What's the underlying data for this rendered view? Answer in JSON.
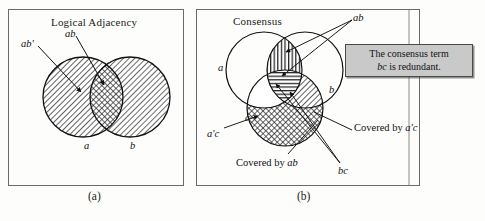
{
  "figure": {
    "panels": [
      {
        "id": "a",
        "caption": "(a)",
        "title": "Logical Adjacency",
        "labels": {
          "ab_prime": "ab'",
          "ab": "ab",
          "a": "a",
          "b": "b"
        },
        "regions": [
          {
            "name": "a-only",
            "fill": "diagonal-hatch"
          },
          {
            "name": "b-only",
            "fill": "diagonal-hatch"
          },
          {
            "name": "a-and-b",
            "fill": "cross-hatch"
          }
        ]
      },
      {
        "id": "b",
        "caption": "(b)",
        "title": "Consensus",
        "labels": {
          "ab": "ab",
          "a": "a",
          "b": "b",
          "c": "c",
          "a_prime_c": "a'c",
          "bc": "bc",
          "covered_by_ab": "Covered by ",
          "covered_by_ab_term": "ab",
          "covered_by_apc": "Covered by ",
          "covered_by_apc_term": "a'c"
        },
        "callout": {
          "line1": "The consensus term",
          "line2_term": "bc",
          "line2_rest": " is redundant."
        },
        "regions": [
          {
            "name": "ab-not-c",
            "fill": "vertical-hatch"
          },
          {
            "name": "abc",
            "fill": "horizontal-hatch"
          },
          {
            "name": "bc-not-a",
            "fill": "diagonal-hatch"
          },
          {
            "name": "c-not-a",
            "fill": "cross-hatch"
          }
        ]
      }
    ],
    "colors": {
      "frame": "#6b6b6b",
      "ink": "#101010",
      "callout_fill": "#c9c9c9",
      "callout_border": "#4a4a4a",
      "page_background": "#fdfdfb"
    }
  }
}
